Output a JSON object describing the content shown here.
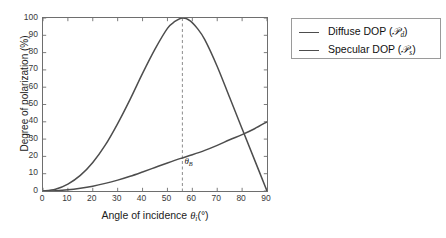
{
  "chart_data": {
    "type": "line",
    "title": "",
    "xlabel": "Angle of incidence θi(°)",
    "ylabel": "Degree of polarization (%)",
    "xlim": [
      0,
      90
    ],
    "ylim": [
      0,
      100
    ],
    "xticks": [
      0,
      10,
      20,
      30,
      40,
      50,
      60,
      70,
      80,
      90
    ],
    "yticks": [
      0,
      10,
      20,
      30,
      40,
      50,
      60,
      70,
      80,
      90,
      100
    ],
    "grid": false,
    "legend_position": "right-outside",
    "annotations": [
      {
        "name": "brewster-angle",
        "label": "θB",
        "label_base": "θ",
        "label_sub": "B",
        "x": 56,
        "type": "vertical-dashed-line",
        "color": "#8c8c8c"
      }
    ],
    "series": [
      {
        "name": "Diffuse DOP (Pd)",
        "label_text": "Diffuse DOP (",
        "label_symbol": "P",
        "label_sub": "d",
        "label_close": ")",
        "color": "#4d4d4d",
        "x": [
          0,
          5,
          10,
          15,
          20,
          25,
          30,
          35,
          40,
          45,
          50,
          55,
          60,
          65,
          70,
          75,
          80,
          85,
          90
        ],
        "y": [
          0.0,
          0.2,
          0.7,
          1.6,
          2.8,
          4.4,
          6.3,
          8.5,
          11.0,
          13.6,
          16.2,
          18.7,
          21.0,
          23.5,
          26.4,
          29.6,
          32.6,
          36.0,
          40.0
        ]
      },
      {
        "name": "Specular DOP (Ps)",
        "label_text": "Specular DOP (",
        "label_symbol": "P",
        "label_sub": "s",
        "label_close": ")",
        "color": "#4d4d4d",
        "x": [
          0,
          5,
          10,
          15,
          20,
          25,
          30,
          35,
          40,
          45,
          50,
          53,
          56,
          59,
          62,
          65,
          70,
          75,
          80,
          85,
          90
        ],
        "y": [
          0.0,
          1.0,
          4.0,
          9.0,
          16.5,
          26.5,
          39.0,
          53.0,
          68.0,
          82.0,
          94.0,
          98.0,
          100.0,
          98.5,
          94.0,
          87.5,
          72.0,
          54.0,
          36.0,
          18.0,
          0.0
        ]
      }
    ]
  },
  "axes": {
    "y_tick_labels": [
      "0",
      "10",
      "20",
      "30",
      "40",
      "50",
      "60",
      "70",
      "80",
      "90",
      "100"
    ],
    "x_tick_labels": [
      "0",
      "10",
      "20",
      "30",
      "40",
      "50",
      "60",
      "70",
      "80",
      "90"
    ],
    "y_axis_title": "Degree of polarization (%)",
    "x_axis_title_main": "Angle of incidence ",
    "x_axis_title_symbol": "θ",
    "x_axis_title_sub": "i",
    "x_axis_title_unit": "(°)"
  },
  "legend": {
    "items": [
      {
        "prefix": "Diffuse DOP (",
        "symbol": "𝒫",
        "subscript": "d",
        "suffix": ")"
      },
      {
        "prefix": "Specular DOP (",
        "symbol": "𝒫",
        "subscript": "s",
        "suffix": ")"
      }
    ]
  },
  "colors": {
    "curve": "#4d4d4d",
    "axis": "#6e6e6e",
    "dashed": "#8c8c8c",
    "text": "#1c1c1c",
    "background": "#ffffff"
  }
}
